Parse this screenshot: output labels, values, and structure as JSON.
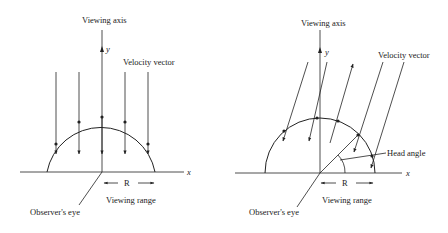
{
  "figures": [
    {
      "id": "left",
      "labels": {
        "viewing_axis": "Viewing axis",
        "y_axis": "y",
        "x_axis": "x",
        "velocity_vector": "Velocity vector",
        "range_symbol": "R",
        "viewing_range": "Viewing range",
        "observer": "Observer's eye"
      },
      "description": "Velocity vectors parallel to the viewing axis, pointing downward toward the x-axis, crossing a semicircular viewing range of radius R."
    },
    {
      "id": "right",
      "labels": {
        "viewing_axis": "Viewing axis",
        "y_axis": "y",
        "x_axis": "x",
        "velocity_vector": "Velocity vector",
        "head_angle": "Head angle",
        "range_symbol": "R",
        "viewing_range": "Viewing range",
        "observer": "Observer's eye"
      },
      "description": "Velocity vectors inclined to the viewing axis; one vector points outward. A head angle is marked between the x-axis and a radial line from the observer."
    }
  ],
  "colors": {
    "line": "#222222",
    "background": "#ffffff"
  }
}
